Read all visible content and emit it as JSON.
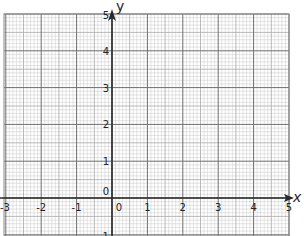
{
  "chart_data": {
    "type": "scatter",
    "title": "",
    "xlabel": "x",
    "ylabel": "y",
    "xlim": [
      -3,
      5
    ],
    "ylim": [
      -1,
      5
    ],
    "x_ticks": [
      -3,
      -2,
      -1,
      0,
      1,
      2,
      3,
      4,
      5
    ],
    "y_ticks": [
      0,
      1,
      2,
      3,
      4,
      5
    ],
    "y_ticks_partial": [
      -1
    ],
    "grid": true,
    "grid_minor_per_unit": 10,
    "series": [],
    "legend": null
  },
  "labels": {
    "x_axis": "x",
    "y_axis": "y",
    "x_ticks": [
      "-3",
      "-2",
      "-1",
      "0",
      "1",
      "2",
      "3",
      "4",
      "5"
    ],
    "y_ticks": [
      "0",
      "1",
      "2",
      "3",
      "4",
      "5"
    ],
    "y_partial": "-1"
  },
  "colors": {
    "minor_grid": "#c8c8c8",
    "mid_grid": "#a8a8a8",
    "major_grid": "#6e6e6e",
    "axis": "#2a2a2a"
  }
}
